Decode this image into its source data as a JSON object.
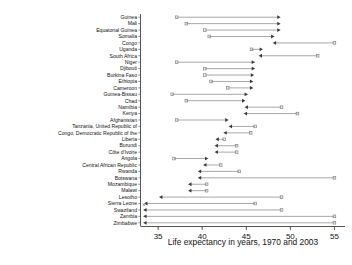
{
  "chart_data": {
    "type": "bar",
    "subtype": "arrow-range-dot-plot",
    "title": "",
    "xlabel": "Life expectancy in years, 1970 and 2003",
    "ylabel": "",
    "xlim": [
      33.0,
      56.2
    ],
    "ylim": null,
    "grid": false,
    "legend": null,
    "xticks": [
      35,
      40,
      45,
      50,
      55
    ],
    "xtick_labels": [
      "35",
      "40",
      "45",
      "50",
      "55"
    ],
    "series": [
      {
        "name": "1970",
        "role": "start-of-arrow"
      },
      {
        "name": "2003",
        "role": "end-of-arrow"
      }
    ],
    "categories": [
      "Guinea",
      "Mali",
      "Equatorial Guinea",
      "Somalia",
      "Congo",
      "Uganda",
      "South Africa",
      "Niger",
      "Djibouti",
      "Burkina Faso",
      "Ethiopia",
      "Cameroon",
      "Guinea-Bissau",
      "Chad",
      "Namibia",
      "Kenya",
      "Afghanistan",
      "Tanzania, United Republic of",
      "Congo, Democratic Republic of the",
      "Liberia",
      "Burundi",
      "Côte d'Ivoire",
      "Angola",
      "Central African Republic",
      "Rwanda",
      "Botswana",
      "Mozambique",
      "Malawi",
      "Lesotho",
      "Sierra Leone",
      "Swaziland",
      "Zambia",
      "Zimbabwe"
    ],
    "points": [
      {
        "country": "Guinea",
        "v1970": 37.1,
        "v2003": 48.9,
        "direction": "right"
      },
      {
        "country": "Mali",
        "v1970": 38.2,
        "v2003": 48.9,
        "direction": "right"
      },
      {
        "country": "Equatorial Guinea",
        "v1970": 40.3,
        "v2003": 48.9,
        "direction": "right"
      },
      {
        "country": "Somalia",
        "v1970": 40.8,
        "v2003": 48.2,
        "direction": "right"
      },
      {
        "country": "Congo",
        "v1970": 55.0,
        "v2003": 48.0,
        "direction": "left"
      },
      {
        "country": "Uganda",
        "v1970": 45.6,
        "v2003": 46.9,
        "direction": "right"
      },
      {
        "country": "South Africa",
        "v1970": 53.1,
        "v2003": 46.4,
        "direction": "left"
      },
      {
        "country": "Niger",
        "v1970": 37.1,
        "v2003": 46.0,
        "direction": "right"
      },
      {
        "country": "Djibouti",
        "v1970": 40.3,
        "v2003": 46.0,
        "direction": "right"
      },
      {
        "country": "Burkina Faso",
        "v1970": 40.3,
        "v2003": 45.9,
        "direction": "right"
      },
      {
        "country": "Ethiopia",
        "v1970": 41.0,
        "v2003": 45.8,
        "direction": "right"
      },
      {
        "country": "Cameroon",
        "v1970": 42.9,
        "v2003": 45.8,
        "direction": "right"
      },
      {
        "country": "Guinea-Bissau",
        "v1970": 36.6,
        "v2003": 45.2,
        "direction": "right"
      },
      {
        "country": "Chad",
        "v1970": 38.2,
        "v2003": 44.9,
        "direction": "right"
      },
      {
        "country": "Namibia",
        "v1970": 49.0,
        "v2003": 44.8,
        "direction": "left"
      },
      {
        "country": "Kenya",
        "v1970": 50.8,
        "v2003": 44.7,
        "direction": "left"
      },
      {
        "country": "Afghanistan",
        "v1970": 37.1,
        "v2003": 43.0,
        "direction": "right"
      },
      {
        "country": "Tanzania, United Republic of",
        "v1970": 46.0,
        "v2003": 43.0,
        "direction": "left"
      },
      {
        "country": "Congo, Democratic Republic of the",
        "v1970": 45.5,
        "v2003": 42.4,
        "direction": "left"
      },
      {
        "country": "Liberia",
        "v1970": 42.5,
        "v2003": 41.5,
        "direction": "left"
      },
      {
        "country": "Burundi",
        "v1970": 43.9,
        "v2003": 41.4,
        "direction": "left"
      },
      {
        "country": "Côte d'Ivoire",
        "v1970": 43.9,
        "v2003": 41.4,
        "direction": "left"
      },
      {
        "country": "Angola",
        "v1970": 36.8,
        "v2003": 40.7,
        "direction": "right"
      },
      {
        "country": "Central African Republic",
        "v1970": 42.1,
        "v2003": 40.1,
        "direction": "left"
      },
      {
        "country": "Rwanda",
        "v1970": 44.2,
        "v2003": 39.5,
        "direction": "left"
      },
      {
        "country": "Botswana",
        "v1970": 55.0,
        "v2003": 39.5,
        "direction": "left"
      },
      {
        "country": "Mozambique",
        "v1970": 40.5,
        "v2003": 38.4,
        "direction": "left"
      },
      {
        "country": "Malawi",
        "v1970": 40.5,
        "v2003": 38.4,
        "direction": "left"
      },
      {
        "country": "Lesotho",
        "v1970": 49.0,
        "v2003": 35.1,
        "direction": "left"
      },
      {
        "country": "Sierra Leone",
        "v1970": 46.0,
        "v2003": 33.4,
        "direction": "left"
      },
      {
        "country": "Swaziland",
        "v1970": 49.0,
        "v2003": 33.3,
        "direction": "left"
      },
      {
        "country": "Zambia",
        "v1970": 55.0,
        "v2003": 33.3,
        "direction": "left"
      },
      {
        "country": "Zimbabwe",
        "v1970": 55.0,
        "v2003": 33.3,
        "direction": "left"
      }
    ],
    "colors": {
      "line": "#8a8a8a",
      "arrowhead": "#3a3a3a",
      "axis": "#2b2b2b",
      "text": "#111111",
      "background": "#ffffff"
    }
  }
}
